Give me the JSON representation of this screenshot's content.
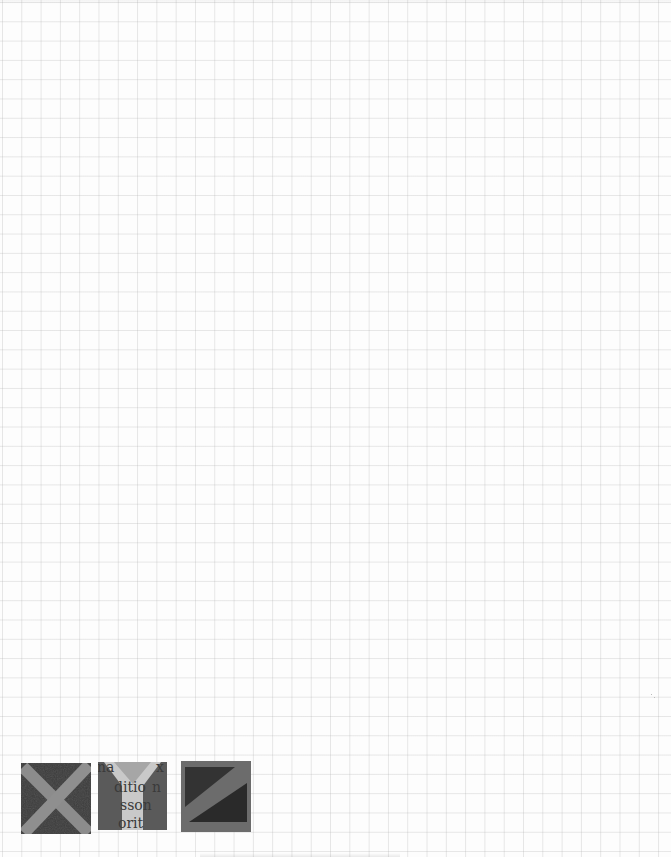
{
  "page": {
    "type": "graph-paper-scan",
    "background": "#fdfdfd",
    "grid_color": "#d6d6d6",
    "grid_spacing_px": 19.3
  },
  "tiles": [
    {
      "letter": "X",
      "bg_color": "#3b3b3b",
      "stroke_color": "#8c8c8c"
    },
    {
      "letter": "Y",
      "bg_color": "#5a5a5a",
      "stroke_color": "#c9c9c9",
      "text_fragments": [
        "na",
        "x",
        "ditio",
        "n",
        "sson",
        "orit"
      ]
    },
    {
      "letter": "Z",
      "bg_color": "#6c6c6c",
      "dark_color": "#2c2c2c",
      "stroke_color": "#6c6c6c"
    }
  ]
}
